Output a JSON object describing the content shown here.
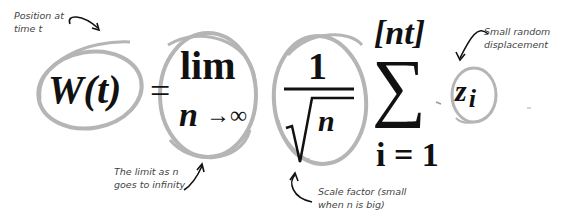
{
  "equation": {
    "lhs": "W(t)",
    "equals": "=",
    "lim_word": "lim",
    "lim_sub_var": "n",
    "lim_sub_arrow": "→∞",
    "frac_num": "1",
    "frac_den_var": "n",
    "sum_symbol": "∑",
    "sum_upper": "[nt]",
    "sum_lower": "i = 1",
    "term": "z",
    "term_sub": "i"
  },
  "annotations": {
    "position": {
      "line1": "Position at",
      "line2": "time t"
    },
    "limit": {
      "line1": "The limit as n",
      "line2": "goes to infinity"
    },
    "scale": {
      "line1": "Scale factor (small",
      "line2": "when n is big)"
    },
    "displacement": {
      "line1": "Small random",
      "line2": "displacement"
    }
  },
  "colors": {
    "circle_stroke": "#b5b5b5",
    "arrow": "#111111",
    "text": "#111111",
    "note_text": "#444444"
  }
}
